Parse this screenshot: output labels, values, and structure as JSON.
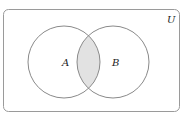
{
  "diagram": {
    "type": "venn",
    "universe_label": "U",
    "sets": [
      {
        "label": "A"
      },
      {
        "label": "B"
      }
    ],
    "shaded_region": "A ∩ B",
    "colors": {
      "stroke": "#8a8a8a",
      "shade": "#e2e2e2",
      "background": "#ffffff"
    }
  }
}
